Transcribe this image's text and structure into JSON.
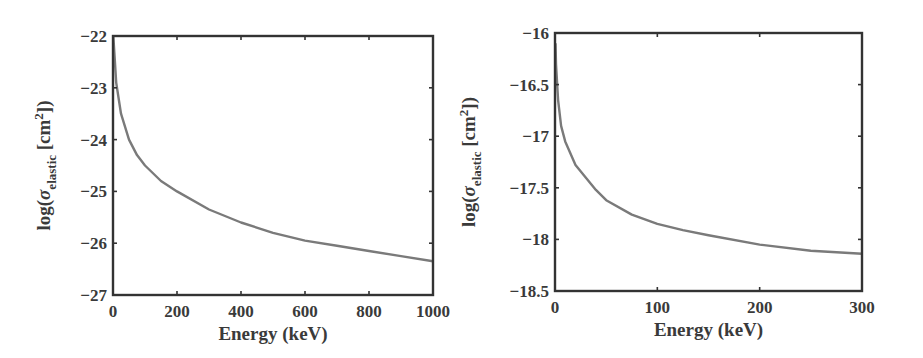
{
  "chart_data": [
    {
      "type": "line",
      "title": "",
      "xlabel": "Energy (keV)",
      "ylabel": "log(σ_elastic [cm^2])",
      "ylabel_parts": {
        "prefix": "log(σ",
        "sub": "elastic",
        "mid": " [cm",
        "sup": "2",
        "suffix": "])"
      },
      "xlim": [
        0,
        1000
      ],
      "ylim": [
        -27,
        -22
      ],
      "xticks": [
        0,
        200,
        400,
        600,
        800,
        1000
      ],
      "xtick_labels": [
        "0",
        "200",
        "400",
        "600",
        "800",
        "1000"
      ],
      "yticks": [
        -22,
        -23,
        -24,
        -25,
        -26,
        -27
      ],
      "ytick_labels": [
        "-22",
        "-23",
        "-24",
        "-25",
        "-26",
        "-27"
      ],
      "grid": false,
      "legend": null,
      "series": [
        {
          "name": "elastic cross section",
          "color": "#7a7a7a",
          "x": [
            1,
            5,
            10,
            25,
            50,
            75,
            100,
            150,
            200,
            300,
            400,
            500,
            600,
            700,
            800,
            900,
            1000
          ],
          "y": [
            -22.0,
            -22.4,
            -22.9,
            -23.5,
            -24.0,
            -24.3,
            -24.5,
            -24.8,
            -25.0,
            -25.35,
            -25.6,
            -25.8,
            -25.95,
            -26.05,
            -26.15,
            -26.25,
            -26.35
          ]
        }
      ],
      "frame": {
        "left": 113,
        "right": 433,
        "top": 36,
        "bottom": 295
      }
    },
    {
      "type": "line",
      "title": "",
      "xlabel": "Energy (keV)",
      "ylabel": "log(σ_elastic [cm^2])",
      "ylabel_parts": {
        "prefix": "log(σ",
        "sub": "elastic",
        "mid": " [cm",
        "sup": "2",
        "suffix": "])"
      },
      "xlim": [
        0,
        300
      ],
      "ylim": [
        -18.5,
        -16
      ],
      "xticks": [
        0,
        100,
        200,
        300
      ],
      "xtick_labels": [
        "0",
        "100",
        "200",
        "300"
      ],
      "yticks": [
        -16,
        -16.5,
        -17,
        -17.5,
        -18,
        -18.5
      ],
      "ytick_labels": [
        "-16",
        "-16.5",
        "-17",
        "-17.5",
        "-18",
        "-18.5"
      ],
      "grid": false,
      "legend": null,
      "series": [
        {
          "name": "elastic cross section",
          "color": "#7a7a7a",
          "x": [
            0.5,
            1,
            3,
            6,
            10,
            20,
            30,
            40,
            50,
            75,
            100,
            125,
            150,
            200,
            250,
            300
          ],
          "y": [
            -16.1,
            -16.3,
            -16.65,
            -16.9,
            -17.05,
            -17.28,
            -17.4,
            -17.52,
            -17.62,
            -17.76,
            -17.85,
            -17.91,
            -17.96,
            -18.05,
            -18.11,
            -18.14
          ]
        }
      ],
      "frame": {
        "left": 555,
        "right": 862,
        "top": 33,
        "bottom": 291
      }
    }
  ]
}
